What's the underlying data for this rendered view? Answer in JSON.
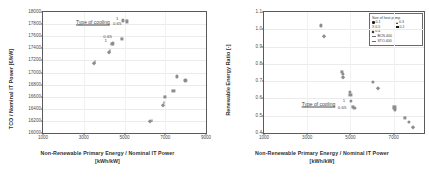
{
  "figure": {
    "title": "",
    "panels": [
      "left",
      "right"
    ]
  },
  "chart_data": [
    {
      "id": "left",
      "type": "scatter",
      "title": "",
      "xlabel": "Non-Renewable Primary Energy / Nominal IT Power\n[kWh/kW]",
      "xlabel_line1": "Non-Renewable Primary Energy / Nominal IT Power",
      "xlabel_line2": "[kWh/kW]",
      "ylabel": "TCO / Nominal IT Power [€/kW]",
      "xlim": [
        1000,
        9000
      ],
      "ylim": [
        16000,
        18000
      ],
      "xticks": [
        1000,
        3000,
        5000,
        7000,
        9000
      ],
      "yticks": [
        16000,
        16200,
        16400,
        16600,
        16800,
        17000,
        17200,
        17400,
        17600,
        17800,
        18000
      ],
      "grid": true,
      "legend": null,
      "annotations": [
        {
          "text": "Type of cooling",
          "x": 3450,
          "y": 17835,
          "underline": true
        },
        {
          "text": "1",
          "x": 4640,
          "y": 17880,
          "underline": false
        },
        {
          "text": "0.65",
          "x": 4640,
          "y": 17800,
          "underline": false
        },
        {
          "text": "0.65",
          "x": 4170,
          "y": 17590,
          "underline": false
        },
        {
          "text": "1",
          "x": 4080,
          "y": 17520,
          "underline": false
        }
      ],
      "points": [
        {
          "x": 3490,
          "y": 17150,
          "marker": "diamond"
        },
        {
          "x": 3560,
          "y": 17185,
          "marker": "triangle"
        },
        {
          "x": 4260,
          "y": 17345,
          "marker": "diamond"
        },
        {
          "x": 4300,
          "y": 17375,
          "marker": "triangle"
        },
        {
          "x": 4390,
          "y": 17470,
          "marker": "square"
        },
        {
          "x": 4430,
          "y": 17480,
          "marker": "circle"
        },
        {
          "x": 4880,
          "y": 17550,
          "marker": "square"
        },
        {
          "x": 4930,
          "y": 17860,
          "marker": "circle"
        },
        {
          "x": 5100,
          "y": 17845,
          "marker": "square"
        },
        {
          "x": 6270,
          "y": 16205,
          "marker": "diamond"
        },
        {
          "x": 6340,
          "y": 16220,
          "marker": "triangle"
        },
        {
          "x": 6880,
          "y": 16470,
          "marker": "diamond"
        },
        {
          "x": 6930,
          "y": 16505,
          "marker": "triangle"
        },
        {
          "x": 6980,
          "y": 16600,
          "marker": "square"
        },
        {
          "x": 7400,
          "y": 16690,
          "marker": "square"
        },
        {
          "x": 7580,
          "y": 16935,
          "marker": "circle"
        },
        {
          "x": 7990,
          "y": 16870,
          "marker": "circle"
        }
      ]
    },
    {
      "id": "right",
      "type": "scatter",
      "title": "",
      "xlabel": "Non-Renewable Primary Energy / Nominal IT Power\n[kWh/kW]",
      "xlabel_line1": "Non-Renewable Primary Energy / Nominal IT Power",
      "xlabel_line2": "[kWh/kW]",
      "ylabel": "Renewable Energy Ratio [-]",
      "xlim": [
        1000,
        8400
      ],
      "ylim": [
        0.4,
        1.1
      ],
      "xticks": [
        1000,
        3000,
        5000,
        7000
      ],
      "yticks": [
        0.4,
        0.5,
        0.6,
        0.7,
        0.8,
        0.9,
        1.0,
        1.1
      ],
      "grid": true,
      "legend": {
        "title": "Size of heat pump",
        "position": "top-right",
        "markers": [
          {
            "label": "0.1",
            "shape": "circle"
          },
          {
            "label": "0.3",
            "shape": "triangle"
          },
          {
            "label": "X 0.5",
            "shape": "none"
          },
          {
            "label": "0.2",
            "shape": "square"
          },
          {
            "label": "0.4",
            "shape": "diamond"
          }
        ],
        "lines": [
          {
            "label": "BCN-400"
          },
          {
            "label": "STO-400"
          }
        ]
      },
      "annotations": [
        {
          "text": "Type of cooling",
          "x": 3520,
          "y": 0.566,
          "underline": true
        },
        {
          "text": "1",
          "x": 4700,
          "y": 0.585,
          "underline": false
        },
        {
          "text": "0.65",
          "x": 4610,
          "y": 0.545,
          "underline": false
        }
      ],
      "points": [
        {
          "x": 3640,
          "y": 1.022,
          "marker": "circle"
        },
        {
          "x": 3760,
          "y": 0.963,
          "marker": "diamond"
        },
        {
          "x": 4620,
          "y": 0.752,
          "marker": "square"
        },
        {
          "x": 4640,
          "y": 0.742,
          "marker": "circle"
        },
        {
          "x": 4670,
          "y": 0.723,
          "marker": "diamond"
        },
        {
          "x": 4990,
          "y": 0.64,
          "marker": "circle"
        },
        {
          "x": 5000,
          "y": 0.621,
          "marker": "square"
        },
        {
          "x": 5030,
          "y": 0.585,
          "marker": "circle"
        },
        {
          "x": 5130,
          "y": 0.553,
          "marker": "square"
        },
        {
          "x": 5180,
          "y": 0.547,
          "marker": "circle"
        },
        {
          "x": 6030,
          "y": 0.697,
          "marker": "circle"
        },
        {
          "x": 6260,
          "y": 0.663,
          "marker": "diamond"
        },
        {
          "x": 7030,
          "y": 0.548,
          "marker": "square"
        },
        {
          "x": 7050,
          "y": 0.536,
          "marker": "circle"
        },
        {
          "x": 7510,
          "y": 0.485,
          "marker": "square"
        },
        {
          "x": 7690,
          "y": 0.464,
          "marker": "circle"
        },
        {
          "x": 7890,
          "y": 0.432,
          "marker": "diamond"
        }
      ]
    }
  ]
}
